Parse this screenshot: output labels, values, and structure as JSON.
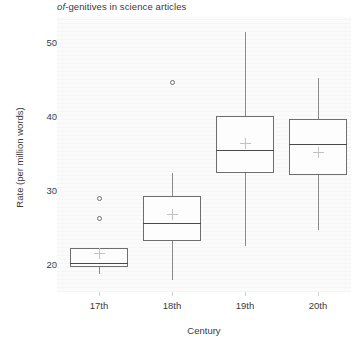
{
  "chart_data": {
    "type": "boxplot",
    "title": "of-genitives in science articles",
    "title_italic_prefix": "of",
    "title_rest": "-genitives in science articles",
    "xlabel": "Century",
    "ylabel": "Rate (per million words)",
    "categories": [
      "17th",
      "18th",
      "19th",
      "20th"
    ],
    "yticks": [
      20,
      30,
      40,
      50
    ],
    "ylim": [
      16.5,
      53.5
    ],
    "grid": false,
    "legend": "none",
    "boxes": [
      {
        "category": "17th",
        "whisker_low": 18.6,
        "q1": 19.6,
        "median": 20.2,
        "q3": 22.2,
        "whisker_high": 22.2,
        "mean": 21.5,
        "outliers": [
          28.9,
          26.2
        ]
      },
      {
        "category": "18th",
        "whisker_low": 17.8,
        "q1": 23.1,
        "median": 25.6,
        "q3": 29.2,
        "whisker_high": 32.3,
        "mean": 26.8,
        "outliers": [
          44.5
        ]
      },
      {
        "category": "19th",
        "whisker_low": 22.4,
        "q1": 32.3,
        "median": 35.4,
        "q3": 40.0,
        "whisker_high": 51.3,
        "mean": 36.4,
        "outliers": []
      },
      {
        "category": "20th",
        "whisker_low": 24.6,
        "q1": 32.0,
        "median": 36.2,
        "q3": 39.6,
        "whisker_high": 45.1,
        "mean": 35.2,
        "outliers": []
      }
    ]
  }
}
